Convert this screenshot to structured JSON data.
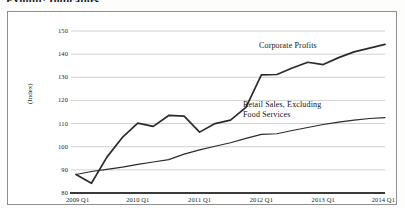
{
  "figure": {
    "heading_truncated": "Exhibit: Indicators",
    "frame_color": "#8f9094"
  },
  "chart_data": {
    "type": "line",
    "title": "",
    "xlabel": "",
    "ylabel": "(Index)",
    "ylim": [
      80,
      150
    ],
    "yticks": [
      80,
      90,
      100,
      110,
      120,
      130,
      140,
      150
    ],
    "grid": true,
    "legend_position": "inline-annotation",
    "x": [
      "2009 Q1",
      "2009 Q2",
      "2009 Q3",
      "2009 Q4",
      "2010 Q1",
      "2010 Q2",
      "2010 Q3",
      "2010 Q4",
      "2011 Q1",
      "2011 Q2",
      "2011 Q3",
      "2011 Q4",
      "2012 Q1",
      "2012 Q2",
      "2012 Q3",
      "2012 Q4",
      "2013 Q1",
      "2013 Q2",
      "2013 Q3",
      "2013 Q4",
      "2014 Q1"
    ],
    "xtick_labels": [
      "2009 Q1",
      "2010 Q1",
      "2011 Q1",
      "2012 Q1",
      "2013 Q1",
      "2014 Q1"
    ],
    "series": [
      {
        "name": "Corporate Profits",
        "color": "#2b2b2e",
        "label_line1": "Corporate Profits",
        "label_line2": "",
        "values": [
          88.0,
          84.2,
          95.5,
          104.0,
          110.2,
          108.8,
          113.5,
          113.2,
          106.3,
          110.0,
          111.5,
          117.0,
          131.0,
          131.2,
          134.0,
          136.5,
          135.5,
          138.5,
          141.0,
          142.6,
          144.2
        ]
      },
      {
        "name": "Retail Sales, Excluding Food Services",
        "color": "#2b2b2e",
        "label_line1": "Retail Sales, Excluding",
        "label_line2": "Food Services",
        "values": [
          88.0,
          89.3,
          90.2,
          91.2,
          92.4,
          93.4,
          94.4,
          96.8,
          98.6,
          100.2,
          101.7,
          103.6,
          105.3,
          105.6,
          107.0,
          108.3,
          109.6,
          110.6,
          111.5,
          112.2,
          112.6
        ]
      }
    ]
  }
}
